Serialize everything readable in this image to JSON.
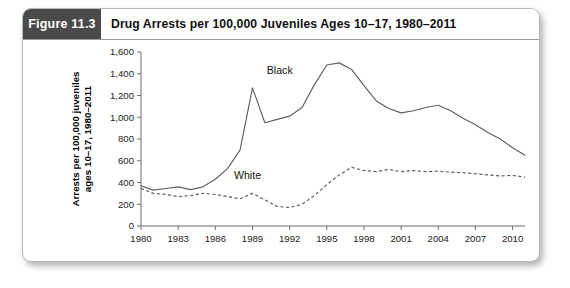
{
  "figure": {
    "badge_label": "Figure 11.3",
    "title": "Drug Arrests per 100,000 Juveniles Ages 10–17, 1980–2011"
  },
  "chart_data": {
    "type": "line",
    "title": "Drug Arrests per 100,000 Juveniles Ages 10–17, 1980–2011",
    "xlabel": "",
    "ylabel_line1": "Arrests per 100,000 juveniles",
    "ylabel_line2": "ages 10–17, 1980–2011",
    "grid": false,
    "legend_position": "inline-labels",
    "ylim": [
      0,
      1600
    ],
    "xlim": [
      1980,
      2011
    ],
    "ytick_labels": [
      "0",
      "200",
      "400",
      "600",
      "800",
      "1,000",
      "1,200",
      "1,400",
      "1,600"
    ],
    "ytick_values": [
      0,
      200,
      400,
      600,
      800,
      1000,
      1200,
      1400,
      1600
    ],
    "xtick_labels": [
      "1980",
      "1983",
      "1986",
      "1989",
      "1992",
      "1995",
      "1998",
      "2001",
      "2004",
      "2007",
      "2010"
    ],
    "xtick_values": [
      1980,
      1983,
      1986,
      1989,
      1992,
      1995,
      1998,
      2001,
      2004,
      2007,
      2010
    ],
    "x": [
      1980,
      1981,
      1982,
      1983,
      1984,
      1985,
      1986,
      1987,
      1988,
      1989,
      1990,
      1991,
      1992,
      1993,
      1994,
      1995,
      1996,
      1997,
      1998,
      1999,
      2000,
      2001,
      2002,
      2003,
      2004,
      2005,
      2006,
      2007,
      2008,
      2009,
      2010,
      2011
    ],
    "series": [
      {
        "name": "Black",
        "style": "solid",
        "annotation": "Black",
        "values": [
          370,
          330,
          345,
          360,
          335,
          360,
          430,
          530,
          700,
          1270,
          950,
          980,
          1010,
          1090,
          1300,
          1480,
          1500,
          1440,
          1290,
          1150,
          1080,
          1040,
          1060,
          1090,
          1110,
          1060,
          990,
          930,
          860,
          800,
          720,
          650
        ]
      },
      {
        "name": "White",
        "style": "dashed",
        "annotation": "White",
        "values": [
          345,
          300,
          290,
          270,
          280,
          300,
          290,
          270,
          250,
          300,
          240,
          180,
          170,
          200,
          280,
          380,
          470,
          540,
          510,
          500,
          520,
          500,
          510,
          500,
          505,
          495,
          490,
          480,
          470,
          460,
          465,
          450
        ]
      }
    ]
  }
}
